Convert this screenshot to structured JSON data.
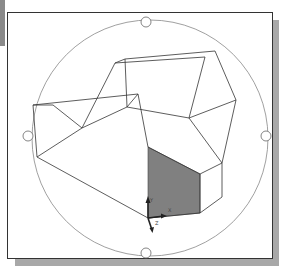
{
  "viewport": {
    "mode": "3D orbit",
    "background": "#ffffff",
    "frame_color": "#333333",
    "shadow_color": "#a8a8a8"
  },
  "orbit": {
    "circle": {
      "cx": 150,
      "cy": 138,
      "r": 118,
      "stroke": "#888888"
    },
    "grips": [
      {
        "name": "top",
        "cx": 146,
        "cy": 22
      },
      {
        "name": "bottom",
        "cx": 146,
        "cy": 253
      },
      {
        "name": "left",
        "cx": 28,
        "cy": 136
      },
      {
        "name": "right",
        "cx": 266,
        "cy": 136
      }
    ]
  },
  "model": {
    "stroke": "#333333",
    "shaded_face_color": "#808080",
    "edges": [
      [
        [
          33,
          105
        ],
        [
          138,
          94
        ]
      ],
      [
        [
          33,
          105
        ],
        [
          37,
          157
        ]
      ],
      [
        [
          33,
          105
        ],
        [
          53,
          105
        ]
      ],
      [
        [
          53,
          105
        ],
        [
          82,
          128
        ]
      ],
      [
        [
          82,
          128
        ],
        [
          127,
          107
        ]
      ],
      [
        [
          127,
          107
        ],
        [
          138,
          94
        ]
      ],
      [
        [
          138,
          94
        ],
        [
          148,
          147
        ]
      ],
      [
        [
          127,
          107
        ],
        [
          189,
          118
        ]
      ],
      [
        [
          82,
          128
        ],
        [
          115,
          63
        ]
      ],
      [
        [
          115,
          63
        ],
        [
          125,
          59
        ]
      ],
      [
        [
          125,
          59
        ],
        [
          215,
          51
        ]
      ],
      [
        [
          115,
          63
        ],
        [
          205,
          57
        ]
      ],
      [
        [
          205,
          57
        ],
        [
          189,
          118
        ]
      ],
      [
        [
          125,
          59
        ],
        [
          127,
          107
        ]
      ],
      [
        [
          215,
          51
        ],
        [
          233,
          93
        ]
      ],
      [
        [
          233,
          93
        ],
        [
          236,
          100
        ]
      ],
      [
        [
          236,
          100
        ],
        [
          222,
          163
        ]
      ],
      [
        [
          189,
          118
        ],
        [
          236,
          100
        ]
      ],
      [
        [
          37,
          157
        ],
        [
          148,
          218
        ]
      ],
      [
        [
          37,
          157
        ],
        [
          82,
          128
        ]
      ],
      [
        [
          148,
          147
        ],
        [
          200,
          174
        ]
      ],
      [
        [
          200,
          174
        ],
        [
          222,
          163
        ]
      ],
      [
        [
          222,
          163
        ],
        [
          222,
          197
        ]
      ],
      [
        [
          222,
          197
        ],
        [
          200,
          213
        ]
      ],
      [
        [
          200,
          174
        ],
        [
          200,
          213
        ]
      ],
      [
        [
          148,
          218
        ],
        [
          200,
          213
        ]
      ],
      [
        [
          189,
          118
        ],
        [
          222,
          163
        ]
      ]
    ],
    "shaded_face": [
      [
        148,
        147
      ],
      [
        200,
        174
      ],
      [
        200,
        213
      ],
      [
        148,
        218
      ]
    ]
  },
  "ucs_icon": {
    "origin": [
      148,
      218
    ],
    "labels": {
      "y": "Y",
      "x": "X",
      "z": "Z"
    }
  }
}
